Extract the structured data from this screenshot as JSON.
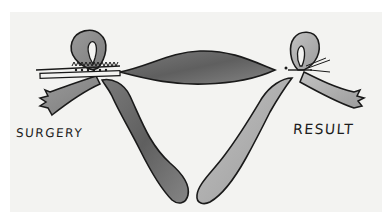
{
  "figure": {
    "type": "hand-drawn medical illustration",
    "colors": {
      "background": "#f3f3f1",
      "outline": "#1a1a1a",
      "fill_dark": "#6e6e6e",
      "fill_mid": "#8f8f8f",
      "fill_light": "#b3b3b3"
    }
  },
  "labels": {
    "left": "SURGERY",
    "right": "RESULT"
  }
}
